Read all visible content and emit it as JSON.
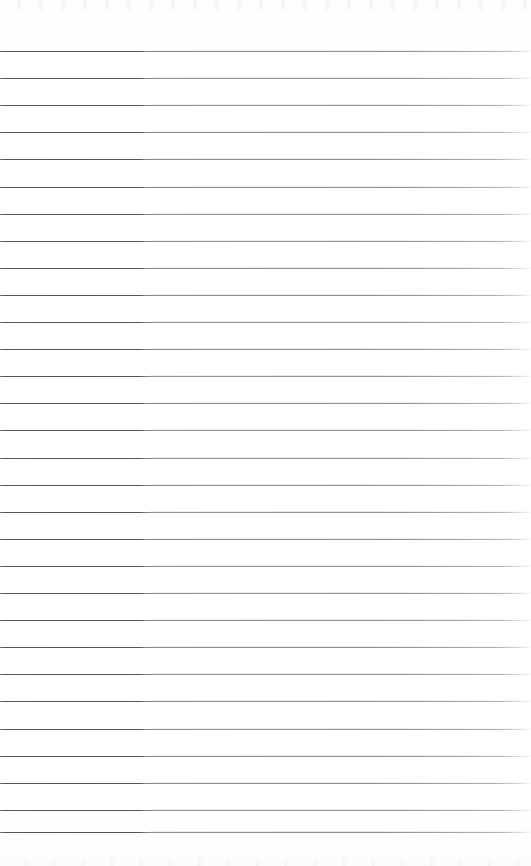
{
  "document": {
    "type": "scanned-lined-notebook-page",
    "title": "Blank Lined Notebook Page",
    "page_width": 531,
    "page_height": 866,
    "background_color": "#ffffff",
    "paper_tint": "#fefefe",
    "content_text": "",
    "is_blank": true
  },
  "ruling": {
    "line_color": "#5e5e66",
    "line_color_faded": "#b4b4be",
    "line_thickness": 1,
    "line_spacing": 27.1,
    "first_line_y": 51,
    "last_line_y": 832,
    "line_count": 30,
    "left_inset": 0,
    "right_inset": 0,
    "top_margin": 51,
    "bottom_margin": 34,
    "lines_y": [
      51,
      78.1,
      105.2,
      132.3,
      159.4,
      186.5,
      213.6,
      240.7,
      267.8,
      294.9,
      322,
      349.1,
      376.2,
      403.3,
      430.4,
      457.5,
      484.6,
      511.7,
      538.8,
      565.9,
      593,
      620.1,
      647.2,
      674.3,
      701.4,
      728.5,
      755.6,
      782.7,
      809.8,
      832
    ]
  },
  "scan_artifacts": {
    "left_band_width": 142,
    "left_band_note": "darker ink band on left portion of each rule",
    "right_fade_note": "lines lighten toward the right edge",
    "top_speckle_height": 10,
    "bottom_speckle_height": 8
  }
}
